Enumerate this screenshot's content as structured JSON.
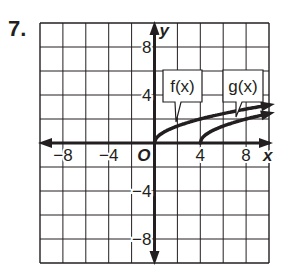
{
  "problem": {
    "number": "7."
  },
  "chart_data": {
    "type": "line",
    "title": "",
    "xlabel": "x",
    "ylabel": "y",
    "xlim": [
      -10,
      10
    ],
    "ylim": [
      -10,
      10
    ],
    "grid": true,
    "grid_step": 2,
    "x_ticks": [
      -8,
      -4,
      4,
      8
    ],
    "x_tick_labels": [
      "−8",
      "−4",
      "4",
      "8"
    ],
    "y_ticks": [
      8,
      4,
      -4,
      -8
    ],
    "y_tick_labels": [
      "8",
      "4",
      "−4",
      "−8"
    ],
    "origin_label": "O",
    "series": [
      {
        "name": "f(x)",
        "label": "f(x)",
        "description": "square-root curve starting at origin",
        "points": [
          [
            0,
            0
          ],
          [
            1,
            1
          ],
          [
            2,
            1.41
          ],
          [
            4,
            2
          ],
          [
            6,
            2.45
          ],
          [
            8,
            2.83
          ],
          [
            10,
            3.16
          ]
        ]
      },
      {
        "name": "g(x)",
        "label": "g(x)",
        "description": "square-root curve starting at (4, 0)",
        "points": [
          [
            4,
            0
          ],
          [
            5,
            1
          ],
          [
            6,
            1.41
          ],
          [
            8,
            2
          ],
          [
            10,
            2.45
          ]
        ]
      }
    ],
    "annotations": [
      {
        "text": "f(x)",
        "points_to": [
          2,
          1.4
        ]
      },
      {
        "text": "g(x)",
        "points_to": [
          7,
          1.7
        ]
      }
    ],
    "colors": {
      "line": "#231f20",
      "grid": "#231f20",
      "background": "#ffffff"
    }
  }
}
